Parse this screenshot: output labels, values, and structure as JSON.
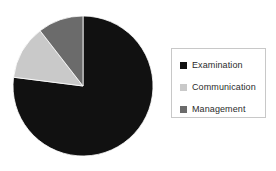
{
  "chart_data": {
    "type": "pie",
    "title": "",
    "labels": [
      "Examination",
      "Communication",
      "Management"
    ],
    "values": [
      77,
      12.5,
      10.5
    ],
    "colors": [
      "#111111",
      "#c9c9c9",
      "#6b6b6b"
    ],
    "legend_position": "right",
    "grid": false,
    "start_angle": 0,
    "direction": "clockwise",
    "center": [
      83,
      86
    ],
    "radius": 70
  },
  "legend": {
    "border_color": "#c8c8c8",
    "background": "#ffffff",
    "items": [
      {
        "label": "Examination",
        "color": "#111111"
      },
      {
        "label": "Communication",
        "color": "#c9c9c9"
      },
      {
        "label": "Management",
        "color": "#6b6b6b"
      }
    ]
  }
}
